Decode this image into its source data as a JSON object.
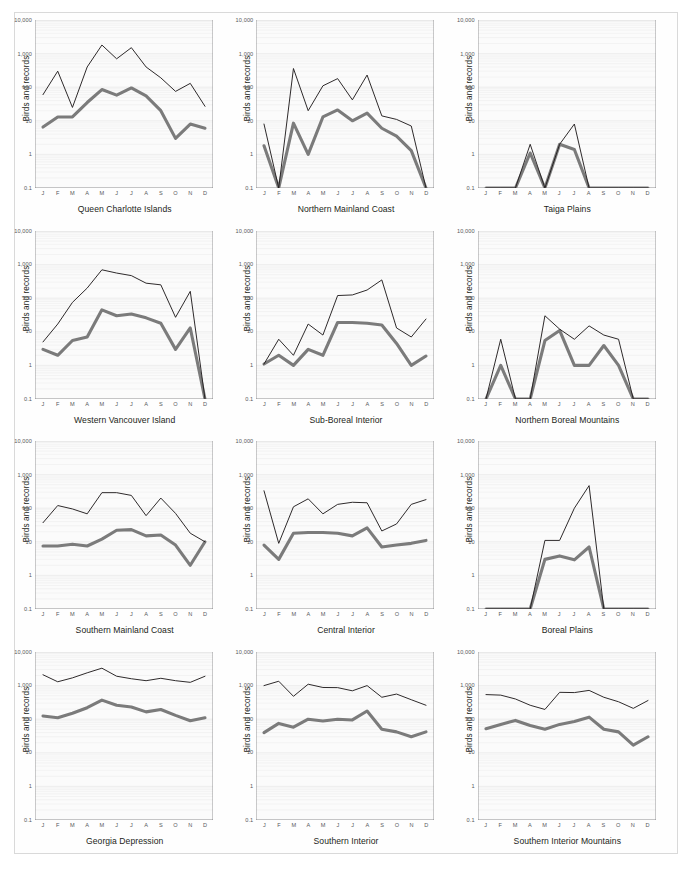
{
  "figure": {
    "ylabel": "Birds and records",
    "y_ticks": [
      "10,000",
      "1,000",
      "100",
      "10",
      "1",
      "0.1"
    ],
    "x_ticks": [
      "J",
      "F",
      "M",
      "A",
      "M",
      "J",
      "J",
      "A",
      "S",
      "O",
      "N",
      "D"
    ],
    "colors": {
      "records_line": "#231f20",
      "birds_line": "#7b7b7b",
      "plot_background": "#fbfbfb",
      "axis": "#6d6e71",
      "frame": "#d9d9d9"
    }
  },
  "chart_data": [
    {
      "type": "line",
      "title": "Queen Charlotte Islands",
      "xlabel": "",
      "ylabel": "Birds and records",
      "categories": [
        "J",
        "F",
        "M",
        "A",
        "M",
        "J",
        "J",
        "A",
        "S",
        "O",
        "N",
        "D"
      ],
      "yscale": "log",
      "ylim": [
        0.1,
        10000
      ],
      "ytick_labels": [
        "10,000",
        "1,000",
        "100",
        "10",
        "1",
        "0.1"
      ],
      "grid": true,
      "legend": "none",
      "series": [
        {
          "name": "records",
          "values": [
            60,
            300,
            25,
            400,
            1800,
            700,
            1500,
            400,
            190,
            75,
            130,
            27
          ]
        },
        {
          "name": "birds",
          "values": [
            6.5,
            13,
            13,
            35,
            85,
            58,
            95,
            55,
            20,
            3,
            8,
            6
          ]
        }
      ]
    },
    {
      "type": "line",
      "title": "Northern Mainland Coast",
      "xlabel": "",
      "ylabel": "Birds and records",
      "categories": [
        "J",
        "F",
        "M",
        "A",
        "M",
        "J",
        "J",
        "A",
        "S",
        "O",
        "N",
        "D"
      ],
      "yscale": "log",
      "ylim": [
        0.1,
        10000
      ],
      "ytick_labels": [
        "10,000",
        "1,000",
        "100",
        "10",
        "1",
        "0.1"
      ],
      "grid": true,
      "legend": "none",
      "series": [
        {
          "name": "records",
          "values": [
            8,
            0.1,
            360,
            20,
            110,
            180,
            42,
            230,
            14,
            11,
            7,
            0.1
          ]
        },
        {
          "name": "birds",
          "values": [
            1.8,
            0.1,
            8.5,
            1.0,
            13,
            21,
            10,
            17,
            6,
            3.5,
            1.3,
            0.1
          ]
        }
      ]
    },
    {
      "type": "line",
      "title": "Taiga Plains",
      "xlabel": "",
      "ylabel": "Birds and records",
      "categories": [
        "J",
        "F",
        "M",
        "A",
        "M",
        "J",
        "J",
        "A",
        "S",
        "O",
        "N",
        "D"
      ],
      "yscale": "log",
      "ylim": [
        0.1,
        10000
      ],
      "ytick_labels": [
        "10,000",
        "1,000",
        "100",
        "10",
        "1",
        "0.1"
      ],
      "grid": true,
      "legend": "none",
      "series": [
        {
          "name": "records",
          "values": [
            0.1,
            0.1,
            0.1,
            2.0,
            0.1,
            2.0,
            8.0,
            0.1,
            0.1,
            0.1,
            0.1,
            0.1
          ]
        },
        {
          "name": "birds",
          "values": [
            0.1,
            0.1,
            0.1,
            1.1,
            0.1,
            2.0,
            1.4,
            0.1,
            0.1,
            0.1,
            0.1,
            0.1
          ]
        }
      ]
    },
    {
      "type": "line",
      "title": "Western Vancouver Island",
      "xlabel": "",
      "ylabel": "Birds and records",
      "categories": [
        "J",
        "F",
        "M",
        "A",
        "M",
        "J",
        "J",
        "A",
        "S",
        "O",
        "N",
        "D"
      ],
      "yscale": "log",
      "ylim": [
        0.1,
        10000
      ],
      "ytick_labels": [
        "10,000",
        "1,000",
        "100",
        "10",
        "1",
        "0.1"
      ],
      "grid": true,
      "legend": "none",
      "series": [
        {
          "name": "records",
          "values": [
            5,
            17,
            75,
            200,
            700,
            560,
            470,
            280,
            250,
            27,
            160,
            0.1
          ]
        },
        {
          "name": "birds",
          "values": [
            3,
            2,
            5.5,
            7,
            45,
            30,
            34,
            26,
            18,
            3,
            13,
            0.1
          ]
        }
      ]
    },
    {
      "type": "line",
      "title": "Sub-Boreal Interior",
      "xlabel": "",
      "ylabel": "Birds and records",
      "categories": [
        "J",
        "F",
        "M",
        "A",
        "M",
        "J",
        "J",
        "A",
        "S",
        "O",
        "N",
        "D"
      ],
      "yscale": "log",
      "ylim": [
        0.1,
        10000
      ],
      "ytick_labels": [
        "10,000",
        "1,000",
        "100",
        "10",
        "1",
        "0.1"
      ],
      "grid": true,
      "legend": "none",
      "series": [
        {
          "name": "records",
          "values": [
            1.1,
            6,
            2,
            17,
            8,
            120,
            125,
            175,
            350,
            13,
            7,
            24
          ]
        },
        {
          "name": "birds",
          "values": [
            1.1,
            2.0,
            1.0,
            3.0,
            2.0,
            19,
            19,
            18,
            16,
            4.5,
            1.0,
            1.9
          ]
        }
      ]
    },
    {
      "type": "line",
      "title": "Northern Boreal Mountains",
      "xlabel": "",
      "ylabel": "Birds and records",
      "categories": [
        "J",
        "F",
        "M",
        "A",
        "M",
        "J",
        "J",
        "A",
        "S",
        "O",
        "N",
        "D"
      ],
      "yscale": "log",
      "ylim": [
        0.1,
        10000
      ],
      "ytick_labels": [
        "10,000",
        "1,000",
        "100",
        "10",
        "1",
        "0.1"
      ],
      "grid": true,
      "legend": "none",
      "series": [
        {
          "name": "records",
          "values": [
            0.1,
            6,
            0.1,
            0.1,
            30,
            12,
            6,
            15,
            8,
            6,
            0.1,
            0.1
          ]
        },
        {
          "name": "birds",
          "values": [
            0.1,
            1.0,
            0.1,
            0.1,
            5.5,
            11,
            1.0,
            1.0,
            3.9,
            1.0,
            0.1,
            0.1
          ]
        }
      ]
    },
    {
      "type": "line",
      "title": "Southern Mainland Coast",
      "xlabel": "",
      "ylabel": "Birds and records",
      "categories": [
        "J",
        "F",
        "M",
        "A",
        "M",
        "J",
        "J",
        "A",
        "S",
        "O",
        "N",
        "D"
      ],
      "yscale": "log",
      "ylim": [
        0.1,
        10000
      ],
      "ytick_labels": [
        "10,000",
        "1,000",
        "100",
        "10",
        "1",
        "0.1"
      ],
      "grid": true,
      "legend": "none",
      "series": [
        {
          "name": "records",
          "values": [
            37,
            120,
            95,
            68,
            290,
            290,
            240,
            60,
            200,
            70,
            18,
            10
          ]
        },
        {
          "name": "birds",
          "values": [
            7.5,
            7.5,
            8.5,
            7.5,
            12,
            22,
            23,
            15,
            16,
            8,
            2,
            10
          ]
        }
      ]
    },
    {
      "type": "line",
      "title": "Central Interior",
      "xlabel": "",
      "ylabel": "Birds and records",
      "categories": [
        "J",
        "F",
        "M",
        "A",
        "M",
        "J",
        "J",
        "A",
        "S",
        "O",
        "N",
        "D"
      ],
      "yscale": "log",
      "ylim": [
        0.1,
        10000
      ],
      "ytick_labels": [
        "10,000",
        "1,000",
        "100",
        "10",
        "1",
        "0.1"
      ],
      "grid": true,
      "legend": "none",
      "series": [
        {
          "name": "records",
          "values": [
            330,
            9,
            110,
            190,
            68,
            130,
            150,
            145,
            21,
            34,
            130,
            180
          ]
        },
        {
          "name": "birds",
          "values": [
            8,
            3,
            18,
            19,
            19,
            18,
            15,
            26,
            7,
            8,
            9,
            11
          ]
        }
      ]
    },
    {
      "type": "line",
      "title": "Boreal Plains",
      "xlabel": "",
      "ylabel": "Birds and records",
      "categories": [
        "J",
        "F",
        "M",
        "A",
        "M",
        "J",
        "J",
        "A",
        "S",
        "O",
        "N",
        "D"
      ],
      "yscale": "log",
      "ylim": [
        0.1,
        10000
      ],
      "ytick_labels": [
        "10,000",
        "1,000",
        "100",
        "10",
        "1",
        "0.1"
      ],
      "grid": true,
      "legend": "none",
      "series": [
        {
          "name": "records",
          "values": [
            0.1,
            0.1,
            0.1,
            0.1,
            11,
            11,
            100,
            470,
            0.1,
            0.1,
            0.1,
            0.1
          ]
        },
        {
          "name": "birds",
          "values": [
            0.1,
            0.1,
            0.1,
            0.1,
            3.0,
            3.8,
            2.9,
            7.0,
            0.1,
            0.1,
            0.1,
            0.1
          ]
        }
      ]
    },
    {
      "type": "line",
      "title": "Georgia Depression",
      "xlabel": "",
      "ylabel": "Birds and records",
      "categories": [
        "J",
        "F",
        "M",
        "A",
        "M",
        "J",
        "J",
        "A",
        "S",
        "O",
        "N",
        "D"
      ],
      "yscale": "log",
      "ylim": [
        0.1,
        10000
      ],
      "ytick_labels": [
        "10,000",
        "1,000",
        "100",
        "10",
        "1",
        "0.1"
      ],
      "grid": true,
      "legend": "none",
      "series": [
        {
          "name": "records",
          "values": [
            2100,
            1300,
            1700,
            2400,
            3300,
            1900,
            1600,
            1400,
            1650,
            1400,
            1250,
            1900
          ]
        },
        {
          "name": "birds",
          "values": [
            125,
            110,
            150,
            220,
            370,
            260,
            230,
            165,
            195,
            130,
            90,
            110
          ]
        }
      ]
    },
    {
      "type": "line",
      "title": "Southern Interior",
      "xlabel": "",
      "ylabel": "Birds and records",
      "categories": [
        "J",
        "F",
        "M",
        "A",
        "M",
        "J",
        "J",
        "A",
        "S",
        "O",
        "N",
        "D"
      ],
      "yscale": "log",
      "ylim": [
        0.1,
        10000
      ],
      "ytick_labels": [
        "10,000",
        "1,000",
        "100",
        "10",
        "1",
        "0.1"
      ],
      "grid": true,
      "legend": "none",
      "series": [
        {
          "name": "records",
          "values": [
            1000,
            1350,
            480,
            1100,
            880,
            870,
            700,
            1000,
            450,
            560,
            380,
            260
          ]
        },
        {
          "name": "birds",
          "values": [
            40,
            75,
            58,
            100,
            88,
            100,
            95,
            175,
            50,
            42,
            30,
            42
          ]
        }
      ]
    },
    {
      "type": "line",
      "title": "Southern Interior Mountains",
      "xlabel": "",
      "ylabel": "Birds and records",
      "categories": [
        "J",
        "F",
        "M",
        "A",
        "M",
        "J",
        "J",
        "A",
        "S",
        "O",
        "N",
        "D"
      ],
      "yscale": "log",
      "ylim": [
        0.1,
        10000
      ],
      "ytick_labels": [
        "10,000",
        "1,000",
        "100",
        "10",
        "1",
        "0.1"
      ],
      "grid": true,
      "legend": "none",
      "series": [
        {
          "name": "records",
          "values": [
            540,
            520,
            400,
            260,
            195,
            630,
            620,
            720,
            450,
            330,
            210,
            360
          ]
        },
        {
          "name": "birds",
          "values": [
            52,
            70,
            92,
            65,
            50,
            70,
            85,
            115,
            50,
            42,
            17,
            30
          ]
        }
      ]
    }
  ]
}
